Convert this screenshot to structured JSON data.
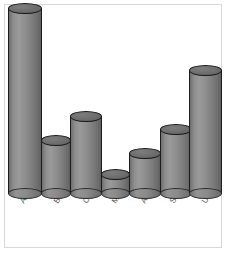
{
  "chart_data": {
    "type": "bar",
    "title": "",
    "subtitle": "",
    "xlabel": "",
    "ylabel": "",
    "categories": [
      "Argentina",
      "Brazil",
      "Chile",
      "Mexico",
      "Australia",
      "South Africa",
      "USA"
    ],
    "values": [
      100,
      29,
      42,
      11,
      22,
      35,
      67
    ],
    "ylim": [
      0,
      100
    ],
    "grid": false,
    "legend": null,
    "legend_position": "none",
    "axis_tick_labels": {
      "x": [
        "Argentina",
        "Brazil",
        "Chile",
        "Mexico",
        "Australia",
        "South Africa",
        "USA"
      ],
      "y": []
    },
    "annotations": [],
    "series": [
      {
        "name": "",
        "values": [
          100,
          29,
          42,
          11,
          22,
          35,
          67
        ]
      }
    ],
    "style": {
      "bar_shape": "cylinder",
      "bar_fill": "#8c8c8c",
      "bar_outline": "#1c1c1c",
      "cap_fill": "#6a6a6a",
      "background": "#ffffff",
      "frame_color": "#d8d8d8",
      "label_color": "#5a5a5a",
      "label_rotation_deg": -56
    }
  },
  "bars": [
    {
      "label": "Argentina",
      "value": 100,
      "left": 8,
      "width": 34,
      "height": 186
    },
    {
      "label": "Brazil",
      "value": 29,
      "left": 41,
      "width": 30,
      "height": 54
    },
    {
      "label": "Chile",
      "value": 42,
      "left": 70,
      "width": 32,
      "height": 78
    },
    {
      "label": "Mexico",
      "value": 11,
      "left": 101,
      "width": 29,
      "height": 20
    },
    {
      "label": "Australia",
      "value": 22,
      "left": 129,
      "width": 32,
      "height": 41
    },
    {
      "label": "South Africa",
      "value": 35,
      "left": 160,
      "width": 32,
      "height": 65
    },
    {
      "label": "USA",
      "value": 67,
      "left": 189,
      "width": 33,
      "height": 124
    }
  ],
  "labels": [
    {
      "text": "Argentina",
      "x": 18,
      "y": 200
    },
    {
      "text": "Brazil",
      "x": 52,
      "y": 200
    },
    {
      "text": "Chile",
      "x": 81,
      "y": 200
    },
    {
      "text": "Mexico",
      "x": 110,
      "y": 200
    },
    {
      "text": "Australia",
      "x": 139,
      "y": 200
    },
    {
      "text": "South Africa",
      "x": 168,
      "y": 200
    },
    {
      "text": "USA",
      "x": 200,
      "y": 200
    }
  ]
}
